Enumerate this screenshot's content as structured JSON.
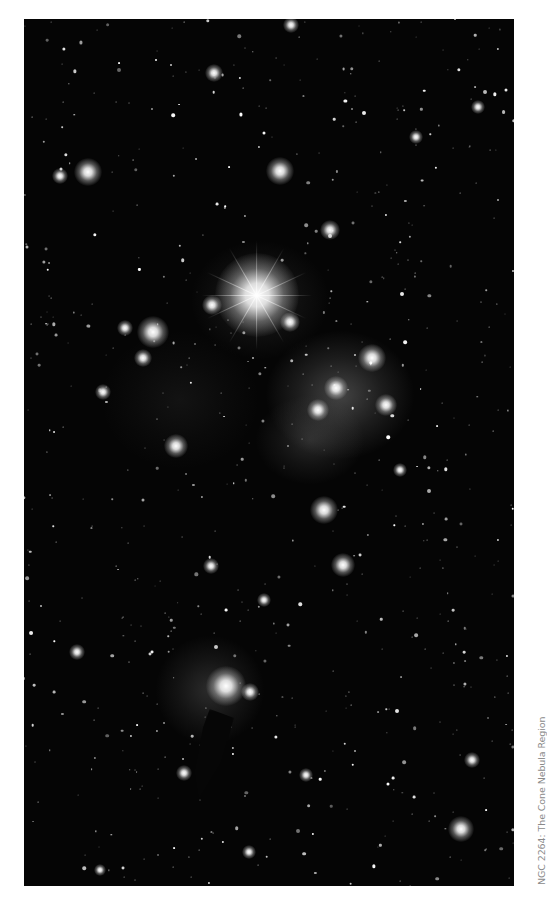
{
  "image": {
    "alt": "Astronomical photograph of a star field with nebulosity and a dark cone-shaped nebula",
    "background_color": "#050505"
  },
  "caption": {
    "text": "NGC 2264: The Cone Nebula Region",
    "color": "#8a8a8a"
  },
  "bright_stars": [
    {
      "x": 257,
      "y": 295,
      "r": 42,
      "spikes": true
    },
    {
      "x": 226,
      "y": 686,
      "r": 20
    },
    {
      "x": 153,
      "y": 332,
      "r": 16
    },
    {
      "x": 88,
      "y": 172,
      "r": 14
    },
    {
      "x": 280,
      "y": 171,
      "r": 14
    },
    {
      "x": 324,
      "y": 510,
      "r": 14
    },
    {
      "x": 343,
      "y": 565,
      "r": 12
    },
    {
      "x": 176,
      "y": 446,
      "r": 12
    },
    {
      "x": 461,
      "y": 829,
      "r": 13
    },
    {
      "x": 372,
      "y": 358,
      "r": 14
    },
    {
      "x": 336,
      "y": 388,
      "r": 12
    },
    {
      "x": 318,
      "y": 410,
      "r": 11
    },
    {
      "x": 386,
      "y": 405,
      "r": 11
    },
    {
      "x": 290,
      "y": 322,
      "r": 10
    },
    {
      "x": 212,
      "y": 305,
      "r": 10
    },
    {
      "x": 330,
      "y": 230,
      "r": 10
    },
    {
      "x": 214,
      "y": 73,
      "r": 9
    },
    {
      "x": 291,
      "y": 25,
      "r": 8
    },
    {
      "x": 143,
      "y": 358,
      "r": 9
    },
    {
      "x": 125,
      "y": 328,
      "r": 8
    },
    {
      "x": 103,
      "y": 392,
      "r": 8
    },
    {
      "x": 60,
      "y": 176,
      "r": 8
    },
    {
      "x": 211,
      "y": 566,
      "r": 8
    },
    {
      "x": 250,
      "y": 692,
      "r": 9
    },
    {
      "x": 184,
      "y": 773,
      "r": 8
    },
    {
      "x": 77,
      "y": 652,
      "r": 8
    },
    {
      "x": 472,
      "y": 760,
      "r": 8
    },
    {
      "x": 400,
      "y": 470,
      "r": 7
    },
    {
      "x": 416,
      "y": 137,
      "r": 7
    },
    {
      "x": 478,
      "y": 107,
      "r": 7
    },
    {
      "x": 264,
      "y": 600,
      "r": 7
    },
    {
      "x": 306,
      "y": 775,
      "r": 7
    },
    {
      "x": 249,
      "y": 852,
      "r": 7
    },
    {
      "x": 100,
      "y": 870,
      "r": 6
    }
  ],
  "nebulae": [
    {
      "x": 340,
      "y": 395,
      "w": 150,
      "h": 130,
      "opacity": 0.32
    },
    {
      "x": 310,
      "y": 440,
      "w": 110,
      "h": 90,
      "opacity": 0.18
    },
    {
      "x": 210,
      "y": 690,
      "w": 110,
      "h": 110,
      "opacity": 0.2
    },
    {
      "x": 260,
      "y": 300,
      "w": 140,
      "h": 120,
      "opacity": 0.14
    },
    {
      "x": 180,
      "y": 400,
      "w": 160,
      "h": 140,
      "opacity": 0.07
    }
  ],
  "field": {
    "count": 650,
    "seed": 2264
  }
}
